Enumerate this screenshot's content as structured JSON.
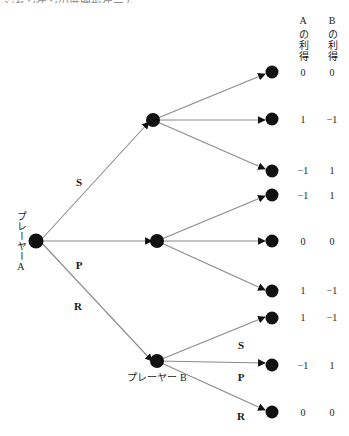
{
  "diagram": {
    "title_fragment": "ジャンケンの展開形ゲーム",
    "type": "extensive-form-game-tree",
    "line_color": "#8a8a8a",
    "node_color": "#111111",
    "text_color": "#1a1a1a"
  },
  "players": {
    "root_label": "プレーヤーA",
    "second_label": "プレーヤー B"
  },
  "payoff_headers": {
    "a_player": "A",
    "a_text": "の利得",
    "b_player": "B",
    "b_text": "の利得"
  },
  "root_branches": [
    {
      "label": "S"
    },
    {
      "label": "P"
    },
    {
      "label": "R"
    }
  ],
  "b_branches": [
    {
      "label": "S"
    },
    {
      "label": "P"
    },
    {
      "label": "R"
    }
  ],
  "outcomes": [
    {
      "a": "0",
      "b": "0"
    },
    {
      "a": "1",
      "b": "−1"
    },
    {
      "a": "−1",
      "b": "1"
    },
    {
      "a": "−1",
      "b": "1"
    },
    {
      "a": "0",
      "b": "0"
    },
    {
      "a": "1",
      "b": "−1"
    },
    {
      "a": "1",
      "b": "−1"
    },
    {
      "a": "−1",
      "b": "1"
    },
    {
      "a": "0",
      "b": "0"
    }
  ]
}
